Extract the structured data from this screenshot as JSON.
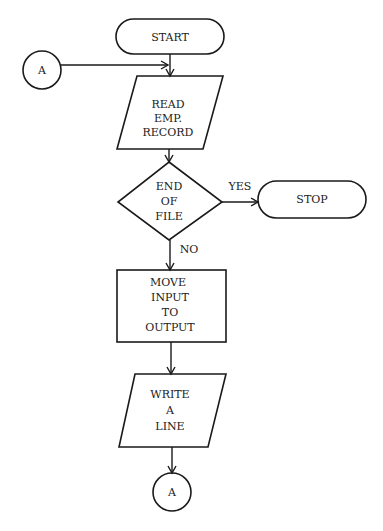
{
  "diagram": {
    "type": "flowchart",
    "nodes": [
      {
        "id": "start",
        "shape": "terminal",
        "lines": [
          "START"
        ]
      },
      {
        "id": "connector_a_in",
        "shape": "connector",
        "lines": [
          "A"
        ]
      },
      {
        "id": "read",
        "shape": "parallelogram",
        "lines": [
          "READ",
          "EMP.",
          "RECORD"
        ]
      },
      {
        "id": "eof",
        "shape": "diamond",
        "lines": [
          "END",
          "OF",
          "FILE"
        ]
      },
      {
        "id": "stop",
        "shape": "terminal",
        "lines": [
          "STOP"
        ]
      },
      {
        "id": "move",
        "shape": "process",
        "lines": [
          "MOVE",
          "INPUT",
          "TO",
          "OUTPUT"
        ]
      },
      {
        "id": "write",
        "shape": "parallelogram",
        "lines": [
          "WRITE",
          "A",
          "LINE"
        ]
      },
      {
        "id": "connector_a_out",
        "shape": "connector",
        "lines": [
          "A"
        ]
      }
    ],
    "edges": [
      {
        "from": "start",
        "to": "read",
        "label": ""
      },
      {
        "from": "connector_a_in",
        "to": "read",
        "label": ""
      },
      {
        "from": "read",
        "to": "eof",
        "label": ""
      },
      {
        "from": "eof",
        "to": "stop",
        "label": "YES"
      },
      {
        "from": "eof",
        "to": "move",
        "label": "NO"
      },
      {
        "from": "move",
        "to": "write",
        "label": ""
      },
      {
        "from": "write",
        "to": "connector_a_out",
        "label": ""
      }
    ],
    "colors": {
      "stroke": "#1a1a1a",
      "background": "#ffffff"
    }
  }
}
